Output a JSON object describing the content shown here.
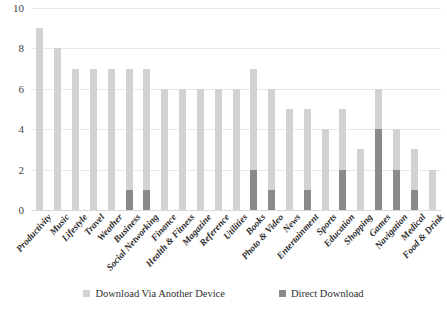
{
  "chart_data": {
    "type": "bar",
    "subtype": "stacked-vertical",
    "title": "",
    "xlabel": "",
    "ylabel": "",
    "ylim": [
      0,
      10
    ],
    "yticks": [
      0,
      2,
      4,
      6,
      8,
      10
    ],
    "grid": true,
    "legend_position": "bottom",
    "categories": [
      "Productivity",
      "Music",
      "Lifestyle",
      "Travel",
      "Weather",
      "Business",
      "Social Networking",
      "Finance",
      "Health & Fitness",
      "Magazine",
      "Reference",
      "Utilities",
      "Books",
      "Photo & Video",
      "News",
      "Entertainment",
      "Sports",
      "Education",
      "Shopping",
      "Games",
      "Navigation",
      "Medical",
      "Food & Drink"
    ],
    "series": [
      {
        "name": "Download Via Another Device",
        "color": "#d2d2d2",
        "values": [
          9,
          8,
          7,
          7,
          7,
          6,
          6,
          6,
          6,
          6,
          6,
          6,
          5,
          5,
          5,
          4,
          4,
          3,
          3,
          2,
          2,
          2,
          2
        ]
      },
      {
        "name": "Direct Download",
        "color": "#8a8a8a",
        "values": [
          0,
          0,
          0,
          0,
          0,
          1,
          1,
          0,
          0,
          0,
          0,
          0,
          2,
          1,
          0,
          1,
          0,
          2,
          0,
          4,
          2,
          1,
          0
        ]
      }
    ],
    "totals": [
      9,
      8,
      7,
      7,
      7,
      7,
      7,
      6,
      6,
      6,
      6,
      6,
      7,
      6,
      5,
      5,
      4,
      5,
      3,
      6,
      4,
      3,
      2
    ]
  },
  "legend": {
    "items": [
      {
        "label": "Download Via Another Device",
        "swatch": "light"
      },
      {
        "label": "Direct Download",
        "swatch": "dark"
      }
    ]
  },
  "colors": {
    "light_gray": "#d2d2d2",
    "dark_gray": "#8a8a8a",
    "gridline": "#e8e8e8",
    "text": "#2e2e2e"
  }
}
